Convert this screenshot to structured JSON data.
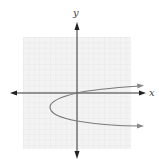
{
  "figure": {
    "type": "coordinate-plane-graph",
    "x_axis_label": "x",
    "y_axis_label": "y",
    "grid": {
      "x_min": -10,
      "x_max": 10,
      "y_min": -10,
      "y_max": 10,
      "step": 1
    },
    "curve": {
      "kind": "parabola-opening-right",
      "vertex": [
        -5,
        -2.5
      ],
      "passes_through": [
        [
          0,
          0
        ],
        [
          0,
          -5
        ]
      ],
      "arrows": [
        "upper-right",
        "lower-right"
      ]
    },
    "colors": {
      "grid": "#e4e4e4",
      "grid_bg": "#f2f2f2",
      "axis": "#333333",
      "curve": "#777777",
      "label": "#444444"
    }
  }
}
